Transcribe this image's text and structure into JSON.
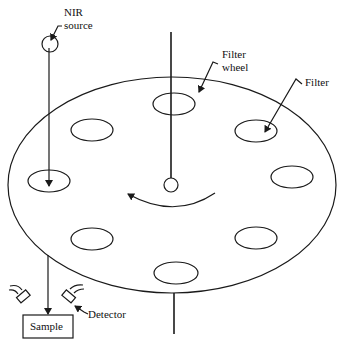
{
  "diagram": {
    "labels": {
      "nir_source_line1": "NIR",
      "nir_source_line2": "source",
      "filter_wheel_line1": "Filter",
      "filter_wheel_line2": "wheel",
      "filter": "Filter",
      "detector": "Detector",
      "sample": "Sample"
    },
    "components": [
      "NIR source",
      "Filter wheel",
      "Filter",
      "Detector",
      "Sample"
    ],
    "filter_count": 8,
    "colors": {
      "stroke": "#1a1a1a",
      "background": "#ffffff"
    }
  }
}
